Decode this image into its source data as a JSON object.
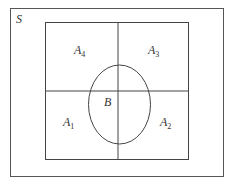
{
  "diagram": {
    "sample_space_label": "S",
    "regions": [
      {
        "name": "A",
        "sub": "4",
        "position": "top-left"
      },
      {
        "name": "A",
        "sub": "3",
        "position": "top-right"
      },
      {
        "name": "A",
        "sub": "1",
        "position": "bottom-left"
      },
      {
        "name": "A",
        "sub": "2",
        "position": "bottom-right"
      }
    ],
    "event_label": "B",
    "colors": {
      "line": "#444444",
      "background": "#ffffff"
    }
  }
}
